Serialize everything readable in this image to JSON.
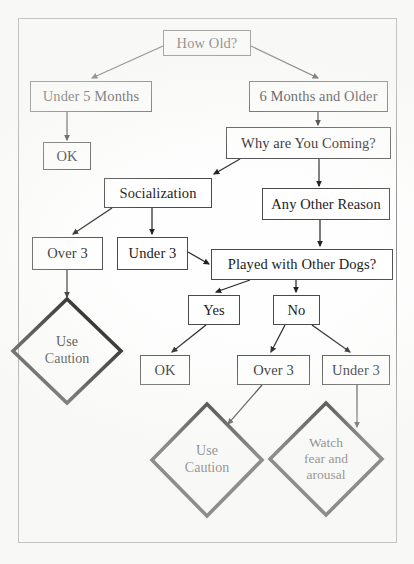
{
  "document": {
    "type": "flowchart",
    "title_text_visible": false,
    "border_color": "#8a8a8a",
    "line_color": "#2a2a2a",
    "box_border_color": "#4a4a4a",
    "background": "#fefefe"
  },
  "nodes": {
    "how_old": {
      "label": "How Old?",
      "x": 163,
      "y": 30,
      "w": 88,
      "h": 26
    },
    "under_5_months": {
      "label": "Under 5 Months",
      "x": 30,
      "y": 81,
      "w": 122,
      "h": 31
    },
    "six_months_and_older": {
      "label": "6 Months and Older",
      "x": 249,
      "y": 81,
      "w": 139,
      "h": 31
    },
    "ok_top": {
      "label": "OK",
      "x": 43,
      "y": 142,
      "w": 48,
      "h": 28
    },
    "why_are_you_coming": {
      "label": "Why are You Coming?",
      "x": 226,
      "y": 127,
      "w": 165,
      "h": 32
    },
    "socialization": {
      "label": "Socialization",
      "x": 104,
      "y": 178,
      "w": 108,
      "h": 30
    },
    "any_other_reason": {
      "label": "Any Other Reason",
      "x": 262,
      "y": 188,
      "w": 128,
      "h": 32
    },
    "over_3_left": {
      "label": "Over 3",
      "x": 32,
      "y": 237,
      "w": 71,
      "h": 33
    },
    "under_3_left": {
      "label": "Under 3",
      "x": 117,
      "y": 237,
      "w": 71,
      "h": 33
    },
    "played_with_other_dogs": {
      "label": "Played with Other Dogs?",
      "x": 211,
      "y": 249,
      "w": 182,
      "h": 31
    },
    "yes": {
      "label": "Yes",
      "x": 188,
      "y": 295,
      "w": 52,
      "h": 30
    },
    "no": {
      "label": "No",
      "x": 273,
      "y": 295,
      "w": 47,
      "h": 30
    },
    "ok_bottom": {
      "label": "OK",
      "x": 140,
      "y": 355,
      "w": 50,
      "h": 30
    },
    "over_3_bottom": {
      "label": "Over 3",
      "x": 237,
      "y": 355,
      "w": 73,
      "h": 30
    },
    "under_3_bottom": {
      "label": "Under 3",
      "x": 322,
      "y": 355,
      "w": 68,
      "h": 30
    }
  },
  "terminals": {
    "use_caution_left": {
      "label_line_1": "Use",
      "label_line_2": "Caution",
      "cx": 67,
      "cy": 351,
      "rx": 54,
      "ry": 52
    },
    "use_caution_center": {
      "label_line_1": "Use",
      "label_line_2": "Caution",
      "cx": 207,
      "cy": 460,
      "rx": 55,
      "ry": 56
    },
    "watch_fear_and_arousal": {
      "label_line_1": "Watch",
      "label_line_2": "fear and",
      "label_line_3": "arousal",
      "cx": 326,
      "cy": 459,
      "rx": 56,
      "ry": 56
    }
  },
  "edges": [
    {
      "name": "how-old-to-under-5-months",
      "from": "how_old",
      "to": "under_5_months"
    },
    {
      "name": "how-old-to-6-months-and-older",
      "from": "how_old",
      "to": "six_months_and_older"
    },
    {
      "name": "under-5-months-to-ok",
      "from": "under_5_months",
      "to": "ok_top"
    },
    {
      "name": "6-months-and-older-to-why-are-you-coming",
      "from": "six_months_and_older",
      "to": "why_are_you_coming"
    },
    {
      "name": "why-are-you-coming-to-socialization",
      "from": "why_are_you_coming",
      "to": "socialization"
    },
    {
      "name": "why-are-you-coming-to-any-other-reason",
      "from": "why_are_you_coming",
      "to": "any_other_reason"
    },
    {
      "name": "socialization-to-over-3",
      "from": "socialization",
      "to": "over_3_left"
    },
    {
      "name": "socialization-to-under-3",
      "from": "socialization",
      "to": "under_3_left"
    },
    {
      "name": "any-other-reason-to-played-with-other-dogs",
      "from": "any_other_reason",
      "to": "played_with_other_dogs"
    },
    {
      "name": "under-3-to-played-with-other-dogs",
      "from": "under_3_left",
      "to": "played_with_other_dogs"
    },
    {
      "name": "over-3-to-use-caution",
      "from": "over_3_left",
      "to": "use_caution_left"
    },
    {
      "name": "played-with-other-dogs-to-yes",
      "from": "played_with_other_dogs",
      "to": "yes"
    },
    {
      "name": "played-with-other-dogs-to-no",
      "from": "played_with_other_dogs",
      "to": "no"
    },
    {
      "name": "yes-to-ok",
      "from": "yes",
      "to": "ok_bottom"
    },
    {
      "name": "no-to-over-3",
      "from": "no",
      "to": "over_3_bottom"
    },
    {
      "name": "no-to-under-3",
      "from": "no",
      "to": "under_3_bottom"
    },
    {
      "name": "over-3-to-use-caution-center",
      "from": "over_3_bottom",
      "to": "use_caution_center"
    },
    {
      "name": "under-3-to-watch-fear-and-arousal",
      "from": "under_3_bottom",
      "to": "watch_fear_and_arousal"
    }
  ]
}
